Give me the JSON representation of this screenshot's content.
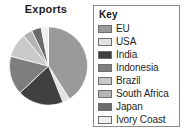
{
  "chart": {
    "title": "Exports"
  },
  "legend": {
    "title": "Key"
  },
  "chart_data": {
    "type": "pie",
    "title": "Exports",
    "legend_title": "Key",
    "legend_position": "right",
    "unit": "percent",
    "categories": [
      "EU",
      "USA",
      "India",
      "Indonesia",
      "Brazil",
      "South Africa",
      "Japan",
      "Ivory Coast"
    ],
    "values": [
      41,
      3,
      19,
      16,
      10,
      4,
      4,
      3
    ],
    "colors": [
      "#9a9a9a",
      "#e2e2e2",
      "#404040",
      "#7e7e7e",
      "#c9c9c9",
      "#b4b4b4",
      "#6b6b6b",
      "#efefef"
    ],
    "start_angle_deg": 0,
    "direction": "clockwise",
    "grid": false,
    "xlabel": "",
    "ylabel": ""
  }
}
